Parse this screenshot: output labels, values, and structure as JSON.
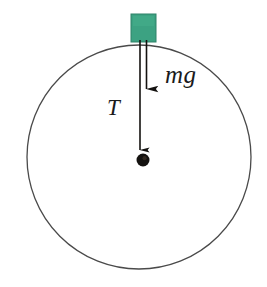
{
  "figure": {
    "background_color": "#ffffff",
    "width": 267,
    "height": 287
  },
  "labels": {
    "weight": "mg",
    "tension": "T"
  },
  "elements": {
    "circle": {
      "name": "circular-path",
      "center_x": 139,
      "center_y": 157,
      "radius": 112,
      "stroke_color": "#4a4a4a",
      "stroke_width": 1.3,
      "fill": "none"
    },
    "block": {
      "name": "green-block",
      "x": 131,
      "y": 14,
      "width": 25,
      "height": 28,
      "fill_color": "#3ca282",
      "stroke_color": "#2f8268"
    },
    "bob": {
      "name": "mass-bob",
      "center_x": 143,
      "center_y": 160,
      "radius": 6.5,
      "fill_color": "#141210"
    },
    "tension_arrow": {
      "name": "tension-arrow",
      "x": 140,
      "y_start": 40,
      "y_end": 152,
      "color": "#121212",
      "stroke_width": 1.6
    },
    "weight_arrow": {
      "name": "weight-arrow",
      "x": 146.5,
      "y_start": 40,
      "y_end": 92,
      "color": "#121212",
      "stroke_width": 1.6
    }
  },
  "colors": {
    "block_green": "#3ca282",
    "outline_gray": "#4a4a4a",
    "ink_black": "#141210",
    "canvas_white": "#ffffff"
  }
}
